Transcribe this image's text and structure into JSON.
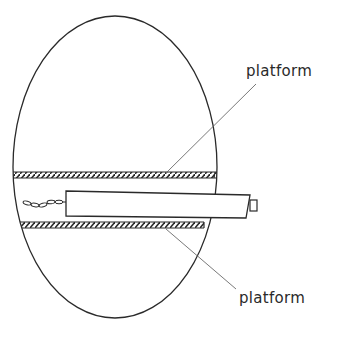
{
  "diagram": {
    "labels": {
      "upper_platform": "platform",
      "lower_platform": "platform"
    },
    "colors": {
      "stroke": "#2a2a2a",
      "leader": "#6a6a6a",
      "background": "#ffffff"
    }
  }
}
